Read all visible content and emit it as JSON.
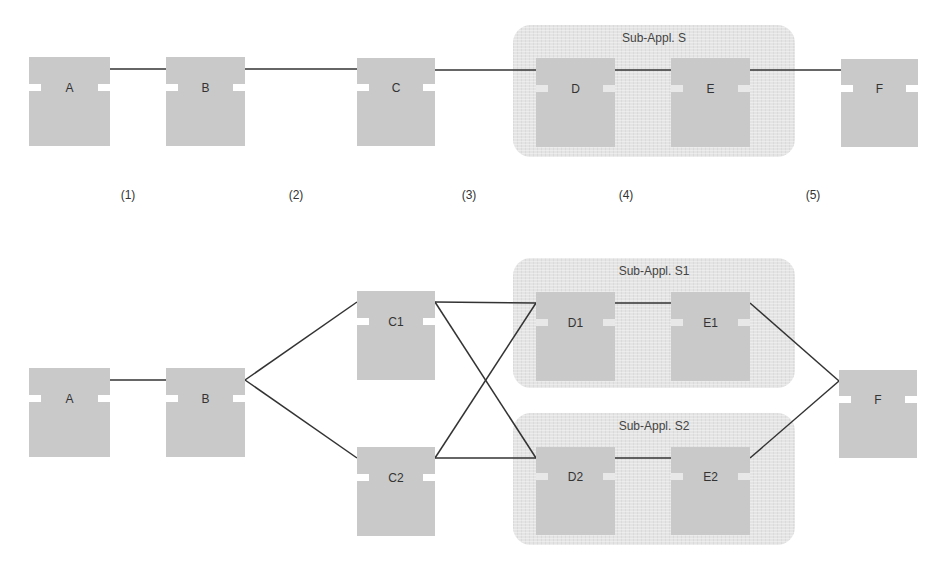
{
  "diagram": {
    "top": {
      "region": {
        "label": "Sub-Appl. S",
        "x": 513,
        "y": 25,
        "w": 282,
        "h": 132
      },
      "boxes": [
        {
          "id": "A",
          "label": "A",
          "x": 29,
          "y": 57,
          "w": 81,
          "h": 89
        },
        {
          "id": "B",
          "label": "B",
          "x": 166,
          "y": 57,
          "w": 79,
          "h": 89
        },
        {
          "id": "C",
          "label": "C",
          "x": 357,
          "y": 58,
          "w": 78,
          "h": 88
        },
        {
          "id": "D",
          "label": "D",
          "x": 536,
          "y": 58,
          "w": 79,
          "h": 89
        },
        {
          "id": "E",
          "label": "E",
          "x": 671,
          "y": 58,
          "w": 79,
          "h": 89
        },
        {
          "id": "F",
          "label": "F",
          "x": 841,
          "y": 59,
          "w": 77,
          "h": 88
        }
      ],
      "connections": [
        [
          "A",
          "B"
        ],
        [
          "B",
          "C"
        ],
        [
          "C",
          "D"
        ],
        [
          "D",
          "E"
        ],
        [
          "E",
          "F"
        ]
      ],
      "step_labels": [
        {
          "label": "(1)",
          "x": 128
        },
        {
          "label": "(2)",
          "x": 296
        },
        {
          "label": "(3)",
          "x": 469
        },
        {
          "label": "(4)",
          "x": 626
        },
        {
          "label": "(5)",
          "x": 813
        }
      ]
    },
    "bottom": {
      "regions": [
        {
          "label": "Sub-Appl. S1",
          "x": 513,
          "y": 258,
          "w": 282,
          "h": 130
        },
        {
          "label": "Sub-Appl. S2",
          "x": 513,
          "y": 413,
          "w": 282,
          "h": 132
        }
      ],
      "boxes": [
        {
          "id": "A",
          "label": "A",
          "x": 29,
          "y": 368,
          "w": 81,
          "h": 89
        },
        {
          "id": "B",
          "label": "B",
          "x": 166,
          "y": 368,
          "w": 79,
          "h": 89
        },
        {
          "id": "C1",
          "label": "C1",
          "x": 357,
          "y": 291,
          "w": 78,
          "h": 89
        },
        {
          "id": "C2",
          "label": "C2",
          "x": 357,
          "y": 447,
          "w": 78,
          "h": 89
        },
        {
          "id": "D1",
          "label": "D1",
          "x": 536,
          "y": 292,
          "w": 79,
          "h": 89
        },
        {
          "id": "E1",
          "label": "E1",
          "x": 671,
          "y": 292,
          "w": 79,
          "h": 89
        },
        {
          "id": "D2",
          "label": "D2",
          "x": 536,
          "y": 447,
          "w": 79,
          "h": 88
        },
        {
          "id": "E2",
          "label": "E2",
          "x": 671,
          "y": 447,
          "w": 79,
          "h": 88
        },
        {
          "id": "F",
          "label": "F",
          "x": 839,
          "y": 370,
          "w": 78,
          "h": 88
        }
      ],
      "connections": [
        [
          "A",
          "B"
        ],
        [
          "B",
          "C1"
        ],
        [
          "B",
          "C2"
        ],
        [
          "C1",
          "D1"
        ],
        [
          "C1",
          "D2"
        ],
        [
          "C2",
          "D1"
        ],
        [
          "C2",
          "D2"
        ],
        [
          "D1",
          "E1"
        ],
        [
          "D2",
          "E2"
        ],
        [
          "E1",
          "F"
        ],
        [
          "E2",
          "F"
        ]
      ]
    }
  }
}
